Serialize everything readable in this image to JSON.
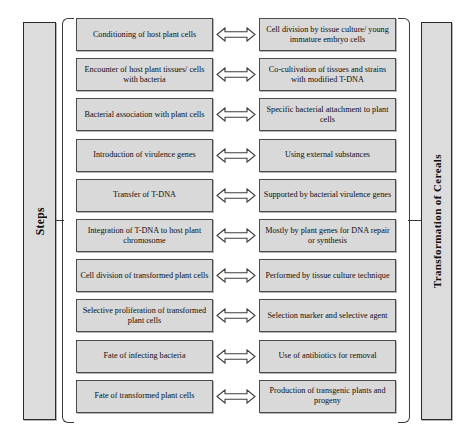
{
  "left_label": {
    "text": "Steps",
    "icon": "vertical-label"
  },
  "right_label": {
    "text": "Transformation of Cereals",
    "icon": "vertical-label"
  },
  "arrow": {
    "icon": "double-headed-horizontal-arrow",
    "glyph": "⟺"
  },
  "colors": {
    "box_fill": "#d9d9d9",
    "box_border": "#4a4a4a",
    "label_fill": "#dcdcdc",
    "label_border": "#2b2b2b",
    "brace": "#3a3a3a",
    "text": "#0e0e0e",
    "background": "#ffffff"
  },
  "rows": [
    {
      "step": "Conditioning of host plant cells",
      "detail": "Cell division by tissue culture/ young immature embryo cells"
    },
    {
      "step": "Encounter of host plant tissues/ cells with bacteria",
      "detail": "Co-cultivation of tissues and strains with modified T-DNA"
    },
    {
      "step": "Bacterial association with plant cells",
      "detail": "Specific bacterial attachment to plant cells"
    },
    {
      "step": "Introduction of virulence genes",
      "detail": "Using external substances"
    },
    {
      "step": "Transfer of T-DNA",
      "detail": "Supported by bacterial virulence genes"
    },
    {
      "step": "Integration of T-DNA to host plant chromosome",
      "detail": "Mostly by plant genes for DNA repair or synthesis"
    },
    {
      "step": "Cell division of transformed plant cells",
      "detail": "Performed by tissue culture technique"
    },
    {
      "step": "Selective proliferation of transformed plant cells",
      "detail": "Selection marker and selective agent"
    },
    {
      "step": "Fate of infecting bacteria",
      "detail": "Use of antibiotics for removal"
    },
    {
      "step": "Fate of transformed plant cells",
      "detail": "Production of transgenic plants and progeny"
    }
  ]
}
